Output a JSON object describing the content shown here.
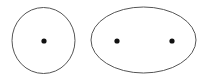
{
  "diagram": {
    "stroke_color": "#555555",
    "point_color": "#111111",
    "shapes": [
      {
        "name": "circle",
        "type": "circle",
        "cx": 43.5,
        "cy": 40.5,
        "rx": 31.5,
        "ry": 33,
        "points": [
          {
            "name": "center",
            "x": 44,
            "y": 41
          }
        ]
      },
      {
        "name": "ellipse",
        "type": "ellipse",
        "cx": 143.5,
        "cy": 40,
        "rx": 52.5,
        "ry": 33,
        "points": [
          {
            "name": "focus-1",
            "x": 117,
            "y": 41
          },
          {
            "name": "focus-2",
            "x": 172,
            "y": 41
          }
        ]
      }
    ]
  }
}
